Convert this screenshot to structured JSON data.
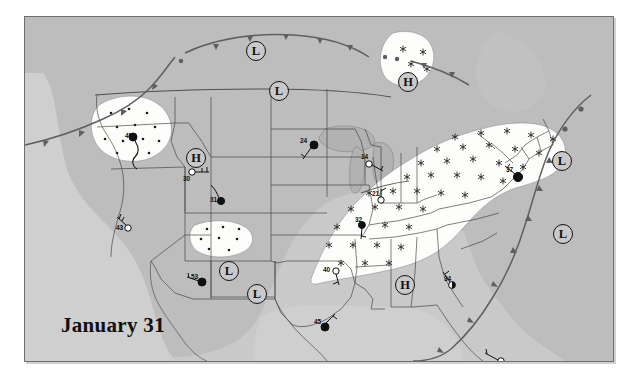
{
  "title": "January 31",
  "map": {
    "background_color": "#c9c9c9",
    "land_color": "#bdbdbd",
    "water_color": "#cfcfcf",
    "precip_fill": "#fdfdfb",
    "line_color": "#6d6d6d",
    "border_color": "#6e6e6e"
  },
  "pressure_centers": [
    {
      "id": "low-1",
      "label": "L",
      "x": 230,
      "y": 33
    },
    {
      "id": "low-2",
      "label": "L",
      "x": 253,
      "y": 73
    },
    {
      "id": "high-1",
      "label": "H",
      "x": 382,
      "y": 64
    },
    {
      "id": "high-2",
      "label": "H",
      "x": 170,
      "y": 140
    },
    {
      "id": "low-3",
      "label": "L",
      "x": 536,
      "y": 143
    },
    {
      "id": "low-4",
      "label": "L",
      "x": 537,
      "y": 216
    },
    {
      "id": "low-5",
      "label": "L",
      "x": 203,
      "y": 253
    },
    {
      "id": "low-6",
      "label": "L",
      "x": 231,
      "y": 276
    },
    {
      "id": "high-3",
      "label": "H",
      "x": 379,
      "y": 267
    }
  ],
  "stations": [
    {
      "id": "station-pacific-nw",
      "temperature": "40",
      "sky": "overcast",
      "x": 108,
      "y": 120,
      "label_x": 100,
      "label_y": 118
    },
    {
      "id": "station-idaho",
      "temperature": "30",
      "sky": "clear",
      "x": 167,
      "y": 155,
      "label_x": 158,
      "label_y": 159
    },
    {
      "id": "station-utah",
      "temperature": "31",
      "sky": "overcast",
      "x": 196,
      "y": 184,
      "label_x": 185,
      "label_y": 181
    },
    {
      "id": "station-dakota",
      "temperature": "24",
      "sky": "overcast",
      "x": 289,
      "y": 128,
      "label_x": 276,
      "label_y": 123
    },
    {
      "id": "station-greatlakes",
      "temperature": "14",
      "sky": "clear",
      "x": 344,
      "y": 147,
      "label_x": 336,
      "label_y": 139
    },
    {
      "id": "station-ohio",
      "temperature": "21",
      "sky": "clear",
      "x": 356,
      "y": 183,
      "label_x": 346,
      "label_y": 179
    },
    {
      "id": "station-tennessee",
      "temperature": "32",
      "sky": "overcast",
      "x": 337,
      "y": 208,
      "label_x": 331,
      "label_y": 202
    },
    {
      "id": "station-california",
      "temperature": "43",
      "sky": "clear",
      "x": 103,
      "y": 211,
      "label_x": 91,
      "label_y": 210
    },
    {
      "id": "station-arizona",
      "temperature": "53",
      "sky": "overcast",
      "x": 177,
      "y": 265,
      "label_x": 167,
      "label_y": 259
    },
    {
      "id": "station-oklahoma",
      "temperature": "40",
      "sky": "clear",
      "x": 311,
      "y": 254,
      "label_x": 298,
      "label_y": 252
    },
    {
      "id": "station-texas",
      "temperature": "45",
      "sky": "overcast",
      "x": 300,
      "y": 310,
      "label_x": 290,
      "label_y": 304
    },
    {
      "id": "station-alabama",
      "temperature": "34",
      "sky": "partly",
      "x": 427,
      "y": 268,
      "label_x": 420,
      "label_y": 261
    },
    {
      "id": "station-florida",
      "temperature": "61",
      "sky": "clear",
      "x": 476,
      "y": 344,
      "label_x": 466,
      "label_y": 351
    },
    {
      "id": "station-northeast",
      "temperature": "37",
      "sky": "overcast",
      "x": 493,
      "y": 160,
      "label_x": 481,
      "label_y": 152
    }
  ],
  "precipitation_areas": [
    {
      "id": "snow-pacific-nw",
      "type": "rain",
      "symbol": "dot"
    },
    {
      "id": "snow-manitoba",
      "type": "snow",
      "symbol": "star"
    },
    {
      "id": "snow-northeast",
      "type": "snow",
      "symbol": "star"
    },
    {
      "id": "rain-fourcorners",
      "type": "rain",
      "symbol": "dot"
    }
  ],
  "fronts": [
    {
      "id": "cold-front-pacific",
      "type": "cold",
      "symbol": "triangle"
    },
    {
      "id": "cold-front-canada",
      "type": "cold",
      "symbol": "triangle"
    },
    {
      "id": "warm-front-atlantic",
      "type": "warm",
      "symbol": "semicircle"
    },
    {
      "id": "cold-front-southeast",
      "type": "cold",
      "symbol": "triangle"
    },
    {
      "id": "occluded-front-west",
      "type": "stationary",
      "symbol": "mixed"
    }
  ]
}
